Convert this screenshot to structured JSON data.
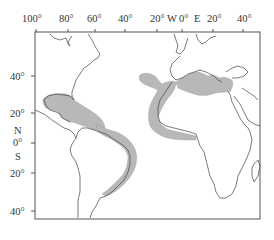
{
  "map": {
    "type": "distribution-map",
    "region": "Atlantic Ocean (Americas, Europe, Africa)",
    "longitude_labels": [
      {
        "text": "100°",
        "value": -100
      },
      {
        "text": "80°",
        "value": -80
      },
      {
        "text": "60°",
        "value": -60
      },
      {
        "text": "40°",
        "value": -40
      },
      {
        "text": "20°",
        "value": -20
      },
      {
        "text": "W",
        "value": null
      },
      {
        "text": "0°",
        "value": 0
      },
      {
        "text": "E",
        "value": null
      },
      {
        "text": "20°",
        "value": 20
      },
      {
        "text": "40°",
        "value": 40
      }
    ],
    "latitude_labels": [
      {
        "text": "40°",
        "value": 40
      },
      {
        "text": "20°",
        "value": 20
      },
      {
        "text": "N",
        "value": null
      },
      {
        "text": "0°",
        "value": 0
      },
      {
        "text": "S",
        "value": null
      },
      {
        "text": "20°",
        "value": -20
      },
      {
        "text": "40°",
        "value": -40
      }
    ],
    "shaded_regions": [
      "Gulf of Mexico",
      "Caribbean Sea",
      "North & northeast coast of South America to southern Brazil",
      "Eastern Atlantic near Azores/Madeira/Canary Islands",
      "West African coast to Gulf of Guinea",
      "Mediterranean Sea"
    ],
    "colors": {
      "shade": "#b8b8b8",
      "coastline": "#444444",
      "frame": "#555555",
      "background": "#ffffff"
    }
  }
}
